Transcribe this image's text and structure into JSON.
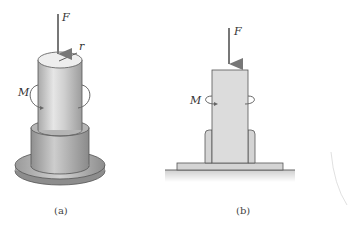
{
  "figure": {
    "panel_a": {
      "caption": "(a)",
      "labels": {
        "force": "F",
        "radius": "r",
        "moment": "M"
      },
      "description": "3D cylindrical shaft inserted in collar on circular base flange, with axial force F and torque M"
    },
    "panel_b": {
      "caption": "(b)",
      "labels": {
        "force": "F",
        "moment": "M"
      },
      "description": "Cross-section of shaft in sleeve on base plate resting on ground, with axial force F and torque M"
    },
    "colors": {
      "arrow": "#7a7a7a",
      "shaft_fill": "#d9d9d9",
      "outline": "#555555",
      "background": "#ffffff"
    }
  }
}
